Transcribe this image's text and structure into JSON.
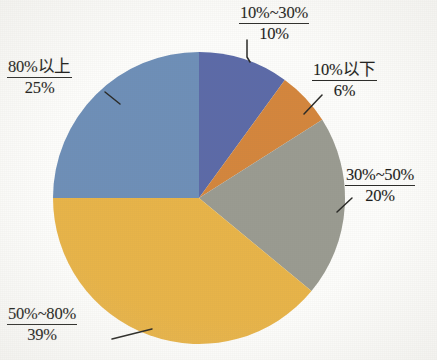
{
  "chart_data": {
    "type": "pie",
    "title": "",
    "subtitle": "",
    "xlabel": "",
    "ylabel": "",
    "legend": "none",
    "grid": false,
    "units": "percent",
    "total": 100,
    "start_angle_deg": 0,
    "direction": "clockwise",
    "categories": [
      "10%~30%",
      "10%以下",
      "30%~50%",
      "50%~80%",
      "80%以上"
    ],
    "values": [
      10,
      6,
      20,
      39,
      25
    ],
    "value_labels": [
      "10%",
      "6%",
      "20%",
      "39%",
      "25%"
    ],
    "colors": [
      "#5b6ba8",
      "#d4863c",
      "#9a9b91",
      "#e8b44a",
      "#6e8fb8"
    ],
    "slices": [
      {
        "id": "slice-10-30",
        "category": "10%~30%",
        "value": 10,
        "value_label": "10%",
        "color": "#5b6ba8",
        "start_deg": 0,
        "end_deg": 36
      },
      {
        "id": "slice-under-10",
        "category": "10%以下",
        "value": 6,
        "value_label": "6%",
        "color": "#d4863c",
        "start_deg": 36,
        "end_deg": 57.6
      },
      {
        "id": "slice-30-50",
        "category": "30%~50%",
        "value": 20,
        "value_label": "20%",
        "color": "#9a9b91",
        "start_deg": 57.6,
        "end_deg": 129.6
      },
      {
        "id": "slice-50-80",
        "category": "50%~80%",
        "value": 39,
        "value_label": "39%",
        "color": "#e8b44a",
        "start_deg": 129.6,
        "end_deg": 270
      },
      {
        "id": "slice-over-80",
        "category": "80%以上",
        "value": 25,
        "value_label": "25%",
        "color": "#6e8fb8",
        "start_deg": 270,
        "end_deg": 360
      }
    ]
  },
  "labels": {
    "slice_1": {
      "category": "10%~30%",
      "value": "10%"
    },
    "slice_2": {
      "category": "10%以下",
      "value": "6%"
    },
    "slice_3": {
      "category": "30%~50%",
      "value": "20%"
    },
    "slice_4": {
      "category": "50%~80%",
      "value": "39%"
    },
    "slice_5": {
      "category": "80%以上",
      "value": "25%"
    }
  }
}
